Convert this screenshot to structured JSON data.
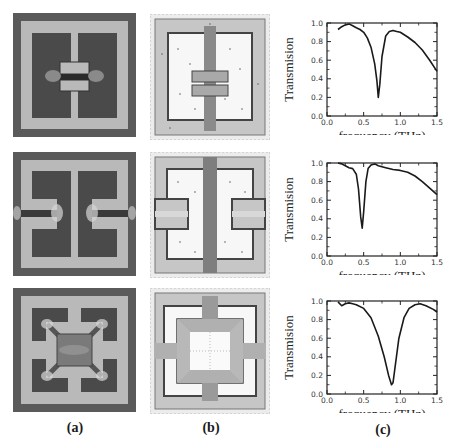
{
  "figure": {
    "column_labels": [
      "(a)",
      "(b)",
      "(c)"
    ],
    "rows": [
      {
        "structure": "H-shaped resonator with central gap (split in middle)",
        "field_view": "electric field concentration at central gap"
      },
      {
        "structure": "double split resonator with side gaps",
        "field_view": "surface current distribution"
      },
      {
        "structure": "square ring resonator with central square patch and diagonal arms",
        "field_view": "surface current distribution"
      }
    ]
  },
  "chart_data": [
    {
      "type": "line",
      "title": "",
      "xlabel": "frequency (THz)",
      "ylabel": "Transmision",
      "xlim": [
        0.0,
        1.5
      ],
      "ylim": [
        0.0,
        1.0
      ],
      "xticks": [
        "0.0",
        "0.5",
        "1.0",
        "1.5"
      ],
      "yticks": [
        "0.0",
        "0.2",
        "0.4",
        "0.6",
        "0.8",
        "1.0"
      ],
      "grid": false,
      "legend": null,
      "series": [
        {
          "name": "row1",
          "x": [
            0.15,
            0.2,
            0.25,
            0.3,
            0.35,
            0.4,
            0.45,
            0.5,
            0.55,
            0.6,
            0.65,
            0.68,
            0.7,
            0.72,
            0.75,
            0.8,
            0.85,
            0.9,
            0.95,
            1.0,
            1.1,
            1.2,
            1.3,
            1.4,
            1.5
          ],
          "y": [
            0.93,
            0.96,
            0.98,
            0.99,
            0.97,
            0.95,
            0.93,
            0.9,
            0.84,
            0.74,
            0.56,
            0.38,
            0.2,
            0.34,
            0.64,
            0.86,
            0.91,
            0.92,
            0.91,
            0.9,
            0.85,
            0.79,
            0.71,
            0.6,
            0.48
          ]
        }
      ]
    },
    {
      "type": "line",
      "title": "",
      "xlabel": "frequency (THz)",
      "ylabel": "Transmision",
      "xlim": [
        0.0,
        1.5
      ],
      "ylim": [
        0.0,
        1.0
      ],
      "xticks": [
        "0.0",
        "0.5",
        "1.0",
        "1.5"
      ],
      "yticks": [
        "0.0",
        "0.2",
        "0.4",
        "0.6",
        "0.8",
        "1.0"
      ],
      "grid": false,
      "legend": null,
      "series": [
        {
          "name": "row2",
          "x": [
            0.15,
            0.2,
            0.25,
            0.3,
            0.35,
            0.4,
            0.43,
            0.46,
            0.48,
            0.5,
            0.53,
            0.56,
            0.6,
            0.65,
            0.7,
            0.8,
            0.9,
            1.0,
            1.1,
            1.2,
            1.3,
            1.4,
            1.5
          ],
          "y": [
            1.0,
            0.99,
            0.97,
            0.95,
            0.94,
            0.88,
            0.72,
            0.42,
            0.3,
            0.48,
            0.8,
            0.94,
            0.98,
            0.99,
            0.97,
            0.95,
            0.93,
            0.92,
            0.9,
            0.86,
            0.8,
            0.73,
            0.66
          ]
        }
      ]
    },
    {
      "type": "line",
      "title": "",
      "xlabel": "frequency (THz)",
      "ylabel": "Transmision",
      "xlim": [
        0.0,
        1.5
      ],
      "ylim": [
        0.0,
        1.0
      ],
      "xticks": [
        "0.0",
        "0.5",
        "1.0",
        "1.5"
      ],
      "yticks": [
        "0.0",
        "0.2",
        "0.4",
        "0.6",
        "0.8",
        "1.0"
      ],
      "grid": false,
      "legend": null,
      "series": [
        {
          "name": "row3",
          "x": [
            0.15,
            0.2,
            0.25,
            0.3,
            0.35,
            0.4,
            0.5,
            0.6,
            0.7,
            0.78,
            0.84,
            0.88,
            0.9,
            0.93,
            0.98,
            1.05,
            1.12,
            1.2,
            1.27,
            1.35,
            1.45,
            1.5
          ],
          "y": [
            0.99,
            0.95,
            0.97,
            0.98,
            0.97,
            0.96,
            0.92,
            0.82,
            0.62,
            0.4,
            0.2,
            0.1,
            0.12,
            0.3,
            0.6,
            0.82,
            0.92,
            0.96,
            0.97,
            0.95,
            0.91,
            0.88
          ]
        }
      ]
    }
  ]
}
